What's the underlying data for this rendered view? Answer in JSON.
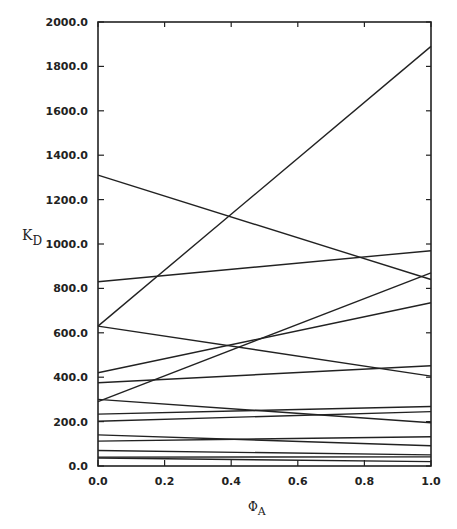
{
  "chart_data": {
    "type": "line",
    "title": "",
    "xlabel": "ΦA",
    "xlabel_parts": {
      "symbol": "Φ",
      "subscript": "A"
    },
    "ylabel": "KD",
    "ylabel_parts": {
      "symbol": "K",
      "subscript": "D"
    },
    "xlim": [
      0.0,
      1.0
    ],
    "ylim": [
      0.0,
      2000.0
    ],
    "x_ticks": [
      "0.0",
      "0.2",
      "0.4",
      "0.6",
      "0.8",
      "1.0"
    ],
    "y_ticks": [
      "0.0",
      "200.0",
      "400.0",
      "600.0",
      "800.0",
      "1000.0",
      "1200.0",
      "1400.0",
      "1600.0",
      "1800.0",
      "2000.0"
    ],
    "grid": false,
    "legend": null,
    "x": [
      0.0,
      1.0
    ],
    "series": [
      {
        "name": "line-1",
        "values": [
          630,
          1890
        ]
      },
      {
        "name": "line-2",
        "values": [
          1310,
          840
        ]
      },
      {
        "name": "line-3",
        "values": [
          830,
          970
        ]
      },
      {
        "name": "line-4",
        "values": [
          290,
          870
        ]
      },
      {
        "name": "line-5",
        "values": [
          630,
          405
        ]
      },
      {
        "name": "line-6",
        "values": [
          420,
          735
        ]
      },
      {
        "name": "line-7",
        "values": [
          375,
          452
        ]
      },
      {
        "name": "line-8",
        "values": [
          300,
          195
        ]
      },
      {
        "name": "line-9",
        "values": [
          234,
          268
        ]
      },
      {
        "name": "line-10",
        "values": [
          202,
          245
        ]
      },
      {
        "name": "line-11",
        "values": [
          140,
          91
        ]
      },
      {
        "name": "line-12",
        "values": [
          112,
          132
        ]
      },
      {
        "name": "line-13",
        "values": [
          70,
          50
        ]
      },
      {
        "name": "line-14",
        "values": [
          40,
          41
        ]
      },
      {
        "name": "line-15",
        "values": [
          36,
          20
        ]
      }
    ],
    "colors": {
      "line": "#222222",
      "axis": "#222222",
      "background": "#ffffff"
    }
  }
}
